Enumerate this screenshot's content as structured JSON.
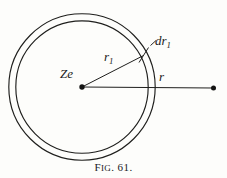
{
  "figure": {
    "caption_prefix": "F",
    "caption_smallcaps": "IG",
    "caption_number": ". 61.",
    "caption_full": "FIG. 61.",
    "background_color": "#fdfdfb",
    "ink_color": "#1a1a1a"
  },
  "labels": {
    "center_charge": {
      "text": "Ze",
      "meaning": "nuclear-charge-label"
    },
    "inner_radius": {
      "base": "r",
      "subscript": "1",
      "text": "r1",
      "meaning": "inner-radius-label"
    },
    "shell_thickness": {
      "dash": "-",
      "base": "dr",
      "subscript": "1",
      "text": "-dr1",
      "meaning": "shell-thickness-label"
    },
    "outer_radius": {
      "base": "r",
      "text": "r",
      "meaning": "outer-radius-label"
    }
  },
  "geometry": {
    "center": {
      "x": 82,
      "y": 87
    },
    "outer_circle_radius": 73.5,
    "inner_circle_radius": 66.5,
    "stroke_width": 1.1,
    "radius_line_r1": {
      "x1": 82,
      "y1": 87,
      "x2": 143,
      "y2": 56
    },
    "radius_line_r": {
      "x1": 82,
      "y1": 87,
      "x2": 214,
      "y2": 88
    },
    "thickness_tick": {
      "x1": 140,
      "y1": 61,
      "x2": 148,
      "y2": 48
    },
    "leader_dash_dr1": {
      "x1": 150,
      "y1": 45,
      "x2": 156,
      "y2": 40
    },
    "center_dot_radius": 2.6,
    "end_dot_radius": 2.4,
    "end_point": {
      "x": 214,
      "y": 88
    }
  }
}
